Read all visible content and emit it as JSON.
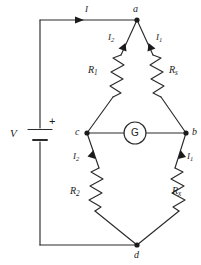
{
  "figure": {
    "kind": "circuit-schematic",
    "name": "wheatstone-bridge",
    "stroke_color": "#2b2b2b",
    "text_color": "#1b1b1b",
    "background": "#ffffff"
  },
  "nodes": [
    {
      "id": "a",
      "label": "a",
      "x": 137,
      "y": 20
    },
    {
      "id": "b",
      "label": "b",
      "x": 186,
      "y": 133
    },
    {
      "id": "c",
      "label": "c",
      "x": 87,
      "y": 133
    },
    {
      "id": "d",
      "label": "d",
      "x": 137,
      "y": 245
    }
  ],
  "components": {
    "source": {
      "symbol": "battery",
      "label": "V",
      "polarity": "+"
    },
    "galvanometer": {
      "symbol": "meter-circle",
      "label": "G"
    },
    "resistors": [
      {
        "id": "R1",
        "base": "R",
        "sub": "1",
        "branch": "a-c"
      },
      {
        "id": "Rs",
        "base": "R",
        "sub": "s",
        "branch": "a-b"
      },
      {
        "id": "R2",
        "base": "R",
        "sub": "2",
        "branch": "c-d"
      },
      {
        "id": "Rx",
        "base": "R",
        "sub": "x",
        "branch": "b-d"
      }
    ]
  },
  "currents": [
    {
      "id": "I",
      "base": "I",
      "sub": "",
      "branch": "supply-top",
      "direction": "right"
    },
    {
      "id": "I2_top",
      "base": "I",
      "sub": "2",
      "branch": "c-to-a",
      "direction": "up"
    },
    {
      "id": "I1_top",
      "base": "I",
      "sub": "1",
      "branch": "b-to-a",
      "direction": "up"
    },
    {
      "id": "I2_bot",
      "base": "I",
      "sub": "2",
      "branch": "d-to-c",
      "direction": "up"
    },
    {
      "id": "I1_bot",
      "base": "I",
      "sub": "1",
      "branch": "d-to-b",
      "direction": "up"
    }
  ]
}
